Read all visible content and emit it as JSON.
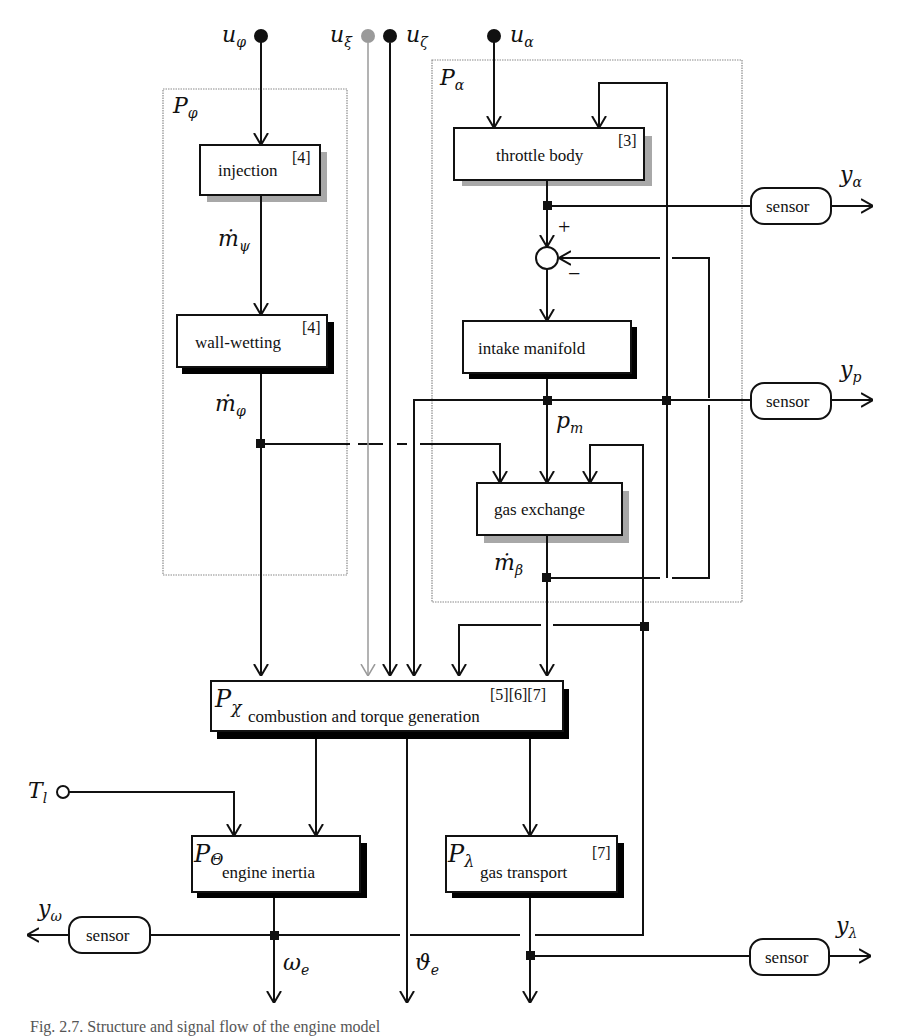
{
  "diagram": {
    "inputs": {
      "u_phi": {
        "base": "u",
        "sub": "φ"
      },
      "u_xi": {
        "base": "u",
        "sub": "ξ"
      },
      "u_zeta": {
        "base": "u",
        "sub": "ζ"
      },
      "u_alpha": {
        "base": "u",
        "sub": "α"
      },
      "T_l": {
        "base": "T",
        "sub": "l"
      }
    },
    "regions": {
      "p_phi": {
        "base": "P",
        "sub": "φ"
      },
      "p_alpha": {
        "base": "P",
        "sub": "α"
      }
    },
    "blocks": {
      "injection": {
        "label": "injection",
        "ref": "[4]"
      },
      "wall_wetting": {
        "label": "wall-wetting",
        "ref": "[4]"
      },
      "throttle_body": {
        "label": "throttle body",
        "ref": "[3]"
      },
      "intake_manifold": {
        "label": "intake manifold"
      },
      "gas_exchange": {
        "label": "gas exchange"
      },
      "combustion": {
        "prefix": "P",
        "sub": "χ",
        "label": "combustion and torque generation",
        "ref": "[5][6][7]"
      },
      "engine_inertia": {
        "prefix": "P",
        "sub": "Θ",
        "label": "engine inertia"
      },
      "gas_transport": {
        "prefix": "P",
        "sub": "λ",
        "label": "gas transport",
        "ref": "[7]"
      }
    },
    "signals": {
      "m_psi": {
        "base": "ṁ",
        "sub": "ψ"
      },
      "m_phi": {
        "base": "ṁ",
        "sub": "φ"
      },
      "p_m": {
        "base": "p",
        "sub": "m"
      },
      "m_beta": {
        "base": "ṁ",
        "sub": "β"
      },
      "omega_e": {
        "base": "ω",
        "sub": "e"
      },
      "theta_e": {
        "base": "ϑ",
        "sub": "e"
      }
    },
    "summing_junction": {
      "plus": "+",
      "minus": "−"
    },
    "sensors": {
      "alpha": {
        "label": "sensor",
        "output": {
          "base": "y",
          "sub": "α"
        }
      },
      "p": {
        "label": "sensor",
        "output": {
          "base": "y",
          "sub": "p"
        }
      },
      "omega": {
        "label": "sensor",
        "output": {
          "base": "y",
          "sub": "ω"
        }
      },
      "lambda": {
        "label": "sensor",
        "output": {
          "base": "y",
          "sub": "λ"
        }
      }
    },
    "caption": "Fig. 2.7. Structure and signal flow of the engine model"
  }
}
